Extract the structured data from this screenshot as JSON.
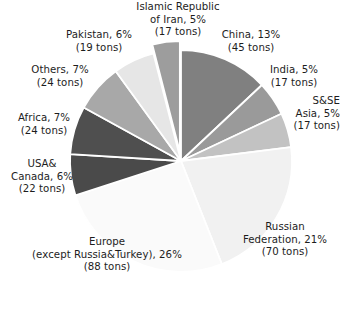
{
  "chart_data": {
    "type": "pie",
    "title": "",
    "unit": "tons",
    "legend_position": "labels-around-pie",
    "grid": false,
    "start_angle_deg": 0,
    "direction": "clockwise",
    "categories": [
      "China",
      "India",
      "S&SE Asia",
      "Russian Federation",
      "Europe (except Russia&Turkey)",
      "USA& Canada",
      "Africa",
      "Others",
      "Pakistan",
      "Islamic Republic of Iran"
    ],
    "values": [
      13,
      5,
      5,
      21,
      26,
      6,
      7,
      7,
      6,
      5
    ],
    "absolute_values": [
      45,
      17,
      17,
      70,
      88,
      22,
      24,
      24,
      19,
      17
    ],
    "colors": [
      "#808080",
      "#9a9a9a",
      "#c2c2c2",
      "#f1f1f1",
      "#fafafa",
      "#4a4a4a",
      "#4f4f4f",
      "#a8a8a8",
      "#e6e6e6",
      "#9d9d9d"
    ],
    "exploded": [
      false,
      false,
      false,
      false,
      false,
      false,
      false,
      false,
      false,
      true
    ],
    "slices": [
      {
        "name": "China",
        "percent": 13,
        "tons": 45,
        "color": "#808080",
        "start": 0,
        "sweep": 46.8
      },
      {
        "name": "India",
        "percent": 5,
        "tons": 17,
        "color": "#9a9a9a",
        "start": 46.8,
        "sweep": 18.0
      },
      {
        "name": "S&SE Asia",
        "percent": 5,
        "tons": 17,
        "color": "#c2c2c2",
        "start": 64.8,
        "sweep": 18.0
      },
      {
        "name": "Russian Federation",
        "percent": 21,
        "tons": 70,
        "color": "#f1f1f1",
        "start": 82.8,
        "sweep": 75.6
      },
      {
        "name": "Europe (except Russia&Turkey)",
        "percent": 26,
        "tons": 88,
        "color": "#fafafa",
        "start": 158.4,
        "sweep": 93.6
      },
      {
        "name": "USA& Canada",
        "percent": 6,
        "tons": 22,
        "color": "#4a4a4a",
        "start": 252.0,
        "sweep": 21.6
      },
      {
        "name": "Africa",
        "percent": 7,
        "tons": 24,
        "color": "#4f4f4f",
        "start": 273.6,
        "sweep": 25.2
      },
      {
        "name": "Others",
        "percent": 7,
        "tons": 24,
        "color": "#a8a8a8",
        "start": 298.8,
        "sweep": 25.2
      },
      {
        "name": "Pakistan",
        "percent": 6,
        "tons": 19,
        "color": "#e6e6e6",
        "start": 324.0,
        "sweep": 21.6
      },
      {
        "name": "Islamic Republic of Iran",
        "percent": 5,
        "tons": 17,
        "color": "#9d9d9d",
        "start": 345.6,
        "sweep": 14.4
      }
    ],
    "xlabel": "",
    "ylabel": ""
  },
  "labels": {
    "iran": "Islamic Republic\nof Iran, 5%\n(17 tons)",
    "china": "China, 13%\n(45 tons)",
    "india": "India, 5%\n(17 tons)",
    "ssea": "S&SE\nAsia, 5%\n(17 tons)",
    "russia": "Russian\nFederation, 21%\n(70 tons)",
    "europe": "Europe\n(except Russia&Turkey), 26%\n(88 tons)",
    "usa": "USA&\nCanada, 6%\n(22 tons)",
    "africa": "Africa, 7%\n(24 tons)",
    "others": "Others, 7%\n(24 tons)",
    "pakistan": "Pakistan, 6%\n(19 tons)"
  },
  "caption": {
    "cut_off_line": ""
  }
}
